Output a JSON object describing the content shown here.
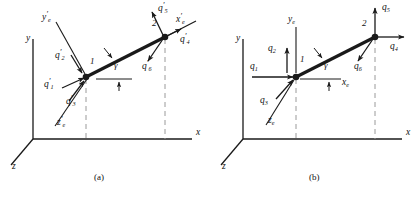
{
  "figure": {
    "type": "structural-mechanics-diagram",
    "stroke_color": "#1a1a1a",
    "dashed_color": "#8a8a8a",
    "background": "#ffffff"
  },
  "panels": [
    {
      "id": "a",
      "caption": "(a)",
      "caption_x": 100,
      "caption_y": 179,
      "coordinate_system": "local",
      "global_axes": [
        {
          "name": "y-axis-label",
          "label": "y",
          "x": 26,
          "y": 40
        },
        {
          "name": "x-axis-label",
          "label": "x",
          "x": 196,
          "y": 134
        },
        {
          "name": "z-axis-label",
          "label": "z",
          "x": 12,
          "y": 168
        }
      ],
      "member_axes": [
        {
          "name": "local-x-axis-label",
          "base": "x",
          "sub": "e",
          "primed": true,
          "x": 176,
          "y": 21
        },
        {
          "name": "local-y-axis-label",
          "base": "y",
          "sub": "e",
          "primed": true,
          "x": 42,
          "y": 19
        },
        {
          "name": "local-z-axis-label",
          "base": "z",
          "sub": "e",
          "primed": true,
          "x": 57,
          "y": 124
        }
      ],
      "nodes": [
        {
          "name": "node-1",
          "label": "1",
          "x": 86,
          "y": 77,
          "label_x": 90,
          "label_y": 62
        },
        {
          "name": "node-2",
          "label": "2",
          "x": 165,
          "y": 37,
          "label_x": 152,
          "label_y": 24
        }
      ],
      "angle": {
        "name": "gamma-angle",
        "symbol": "γ",
        "x": 114,
        "y": 66
      },
      "forces": [
        {
          "name": "force-q1-prime",
          "base": "q",
          "sub": "1",
          "primed": true,
          "x": 51,
          "y": 86
        },
        {
          "name": "force-q2-prime",
          "base": "q",
          "sub": "2",
          "primed": true,
          "x": 62,
          "y": 57
        },
        {
          "name": "force-q3-prime",
          "base": "q",
          "sub": "3",
          "primed": true,
          "x": 72,
          "y": 103
        },
        {
          "name": "force-q4-prime",
          "base": "q",
          "sub": "4",
          "primed": true,
          "x": 180,
          "y": 41
        },
        {
          "name": "force-q5-prime",
          "base": "q",
          "sub": "5",
          "primed": true,
          "x": 160,
          "y": 9
        },
        {
          "name": "force-q6-prime",
          "base": "q",
          "sub": "6",
          "primed": true,
          "x": 146,
          "y": 67
        }
      ]
    },
    {
      "id": "b",
      "caption": "(b)",
      "caption_x": 315,
      "caption_y": 179,
      "coordinate_system": "global",
      "global_axes": [
        {
          "name": "y-axis-label",
          "label": "y",
          "x": 236,
          "y": 40
        },
        {
          "name": "x-axis-label",
          "label": "x",
          "x": 406,
          "y": 134
        },
        {
          "name": "z-axis-label",
          "label": "z",
          "x": 222,
          "y": 168
        }
      ],
      "member_axes": [
        {
          "name": "local-x-axis-label",
          "base": "x",
          "sub": "e",
          "primed": false,
          "x": 342,
          "y": 84
        },
        {
          "name": "local-y-axis-label",
          "base": "y",
          "sub": "e",
          "primed": false,
          "x": 290,
          "y": 21
        },
        {
          "name": "local-z-axis-label",
          "base": "z",
          "sub": "e",
          "primed": false,
          "x": 271,
          "y": 122
        }
      ],
      "nodes": [
        {
          "name": "node-1",
          "label": "1",
          "x": 296,
          "y": 77,
          "label_x": 300,
          "label_y": 60
        },
        {
          "name": "node-2",
          "label": "2",
          "x": 375,
          "y": 37,
          "label_x": 362,
          "label_y": 24
        }
      ],
      "angle": {
        "name": "gamma-angle",
        "symbol": "γ",
        "x": 324,
        "y": 66
      },
      "forces": [
        {
          "name": "force-q1",
          "base": "q",
          "sub": "1",
          "primed": false,
          "x": 256,
          "y": 68
        },
        {
          "name": "force-q2",
          "base": "q",
          "sub": "2",
          "primed": false,
          "x": 272,
          "y": 50
        },
        {
          "name": "force-q3",
          "base": "q",
          "sub": "3",
          "primed": false,
          "x": 264,
          "y": 102
        },
        {
          "name": "force-q4",
          "base": "q",
          "sub": "4",
          "primed": false,
          "x": 392,
          "y": 48
        },
        {
          "name": "force-q5",
          "base": "q",
          "sub": "5",
          "primed": false,
          "x": 384,
          "y": 8
        },
        {
          "name": "force-q6",
          "base": "q",
          "sub": "6",
          "primed": false,
          "x": 358,
          "y": 67
        }
      ]
    }
  ]
}
